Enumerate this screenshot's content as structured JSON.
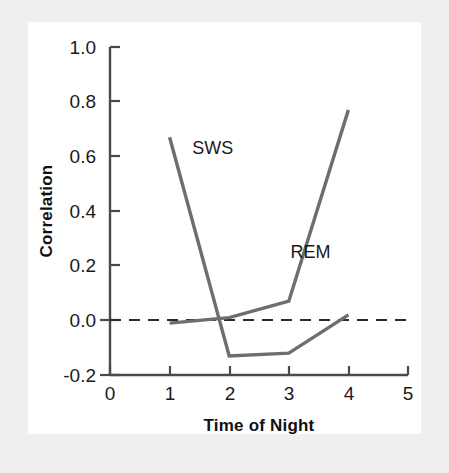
{
  "chart_data": {
    "type": "line",
    "title": "",
    "xlabel": "Time of Night",
    "ylabel": "Correlation",
    "xlim": [
      0,
      5
    ],
    "ylim": [
      -0.2,
      1.0
    ],
    "grid": false,
    "legend": "inline-annotations",
    "x_ticks": [
      "0",
      "1",
      "2",
      "3",
      "4",
      "5"
    ],
    "x_tick_values": [
      0,
      1,
      2,
      3,
      4,
      5
    ],
    "y_ticks": [
      "-0.2",
      "0.0",
      "0.2",
      "0.4",
      "0.6",
      "0.8",
      "1.0"
    ],
    "y_tick_values": [
      -0.2,
      0.0,
      0.2,
      0.4,
      0.6,
      0.8,
      1.0
    ],
    "x": [
      1,
      2,
      3,
      4
    ],
    "series": [
      {
        "name": "SWS",
        "label": "SWS",
        "color": "#6e6e6e",
        "values": [
          0.67,
          -0.13,
          -0.12,
          0.02
        ],
        "label_x": 1.38,
        "label_y": 0.61
      },
      {
        "name": "REM",
        "label": "REM",
        "color": "#6e6e6e",
        "values": [
          -0.01,
          0.01,
          0.07,
          0.77
        ],
        "label_x": 3.03,
        "label_y": 0.23
      }
    ],
    "reference_lines": [
      {
        "name": "zero-line",
        "axis": "y",
        "value": 0.0,
        "style": "dashed",
        "color": "#2a2a2a"
      }
    ]
  },
  "figure": {
    "background_color": "#efefed",
    "plot_background_color": "#ffffff"
  }
}
